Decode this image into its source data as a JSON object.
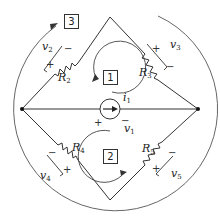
{
  "diagram": {
    "type": "circuit",
    "resistors": [
      {
        "name": "R",
        "sub": "2",
        "voltage": "v",
        "vsub": "2"
      },
      {
        "name": "R",
        "sub": "3",
        "voltage": "v",
        "vsub": "3"
      },
      {
        "name": "R",
        "sub": "4",
        "voltage": "v",
        "vsub": "4"
      },
      {
        "name": "R",
        "sub": "5",
        "voltage": "v",
        "vsub": "5"
      }
    ],
    "source": {
      "name": "i",
      "sub": "1",
      "voltage": "v",
      "vsub": "1"
    },
    "loops": [
      "1",
      "2",
      "3"
    ],
    "signs": {
      "plus": "+",
      "minus": "−"
    }
  }
}
